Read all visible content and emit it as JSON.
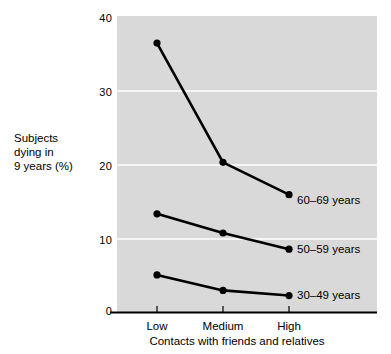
{
  "chart_data": {
    "type": "line",
    "title": "",
    "subtitle": "",
    "xlabel": "Contacts with friends and relatives",
    "ylabel": "Subjects dying in 9 years (%)",
    "ylabel_lines": [
      "Subjects",
      "dying in",
      "9 years (%)"
    ],
    "categories": [
      "Low",
      "Medium",
      "High"
    ],
    "x_tick_labels": [
      "Low",
      "Medium",
      "High"
    ],
    "y_tick_labels": [
      "0",
      "10",
      "20",
      "30",
      "40"
    ],
    "y_ticks": [
      0,
      10,
      20,
      30,
      40
    ],
    "ylim": [
      0,
      40
    ],
    "xlim": [
      0,
      2
    ],
    "grid": "horizontal-white-gridlines",
    "legend_position": "inline-right-of-last-point",
    "plot_background": "#d9d9d9",
    "gridline_color": "#f6f6f6",
    "line_color": "#000000",
    "marker": "filled-circle",
    "series": [
      {
        "name": "60–69 years",
        "label": "60–69 years",
        "values": [
          36.6,
          20.4,
          16.0
        ]
      },
      {
        "name": "50–59 years",
        "label": "50–59 years",
        "values": [
          13.4,
          10.8,
          8.6
        ]
      },
      {
        "name": "30–49 years",
        "label": "30–49 years",
        "values": [
          5.1,
          3.0,
          2.3
        ]
      }
    ]
  },
  "axis": {
    "y_ticks": [
      {
        "label": "40",
        "value": 40
      },
      {
        "label": "30",
        "value": 30
      },
      {
        "label": "20",
        "value": 20
      },
      {
        "label": "10",
        "value": 10
      },
      {
        "label": "0",
        "value": 0
      }
    ],
    "x_ticks": [
      {
        "label": "Low"
      },
      {
        "label": "Medium"
      },
      {
        "label": "High"
      }
    ]
  },
  "labels": {
    "y_axis_line1": "Subjects",
    "y_axis_line2": "dying in",
    "y_axis_line3": "9 years (%)",
    "x_axis_title": "Contacts with friends and relatives",
    "series_60_69": "60–69 years",
    "series_50_59": "50–59 years",
    "series_30_49": "30–49 years",
    "ytick_40": "40",
    "ytick_30": "30",
    "ytick_20": "20",
    "ytick_10": "10",
    "ytick_0": "0",
    "xtick_low": "Low",
    "xtick_medium": "Medium",
    "xtick_high": "High"
  }
}
